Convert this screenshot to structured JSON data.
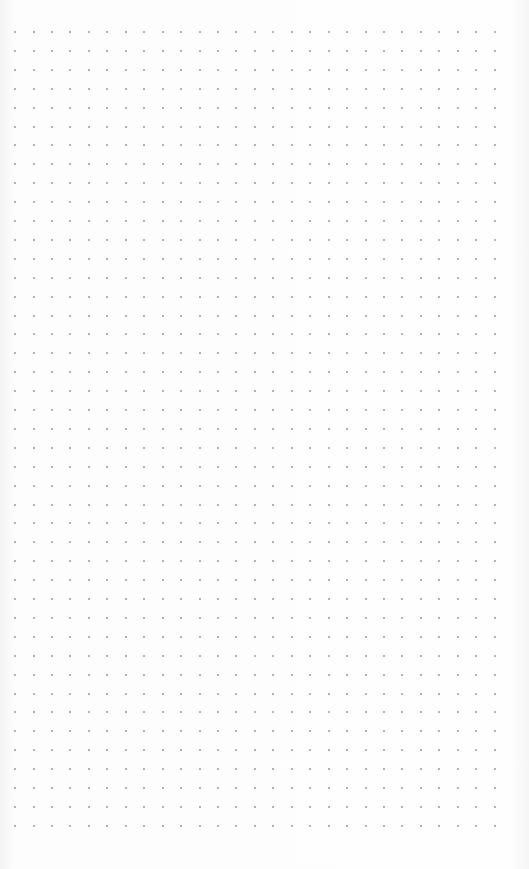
{
  "page": {
    "type": "dot-grid paper",
    "background_color": "#fdfdfd",
    "dot_color": "#9a9a9a"
  },
  "grid": {
    "columns": 27,
    "rows": 43,
    "origin_x": 15,
    "origin_y": 32,
    "spacing_x": 18.45,
    "spacing_y": 18.9
  }
}
